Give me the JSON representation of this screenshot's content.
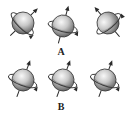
{
  "figure": {
    "colors": {
      "sphere_light": "#f4f4f4",
      "sphere_mid": "#bdbdbd",
      "sphere_dark": "#6e6e6e",
      "outline": "#3a3a3a",
      "axis": "#2a2a2a"
    },
    "rows": [
      {
        "label": "A",
        "label_pos": [
          61,
          47
        ],
        "spheres": [
          {
            "cx": 23,
            "cy": 23,
            "r": 11,
            "axis_angle": 45
          },
          {
            "cx": 63,
            "cy": 26,
            "r": 11,
            "axis_angle": 15
          },
          {
            "cx": 108,
            "cy": 23,
            "r": 11,
            "axis_angle": -40
          }
        ]
      },
      {
        "label": "B",
        "label_pos": [
          61,
          102
        ],
        "spheres": [
          {
            "cx": 23,
            "cy": 80,
            "r": 11,
            "axis_angle": 20
          },
          {
            "cx": 63,
            "cy": 80,
            "r": 11,
            "axis_angle": 20
          },
          {
            "cx": 105,
            "cy": 80,
            "r": 11,
            "axis_angle": 20
          }
        ]
      }
    ]
  }
}
